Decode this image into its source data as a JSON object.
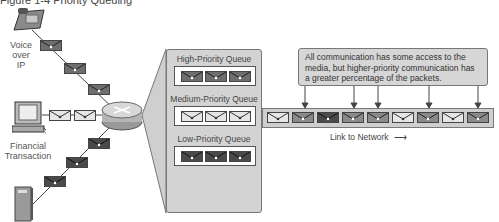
{
  "caption": "Figure 1-4  Priority Queuing",
  "sources": [
    {
      "label_lines": [
        "Voice",
        "over",
        "IP"
      ],
      "icon": "ip-phone-icon"
    },
    {
      "label_lines": [
        "Financial",
        "Transaction"
      ],
      "icon": "workstation-icon"
    },
    {
      "label_lines": [],
      "icon": "server-icon"
    }
  ],
  "router": {
    "icon": "router-icon"
  },
  "queues": [
    {
      "title": "High-Priority Queue",
      "packet_shade": "#6e6e6e",
      "packets": 3
    },
    {
      "title": "Medium-Priority Queue",
      "packet_shade": "#e6e6e6",
      "packets": 3
    },
    {
      "title": "Low-Priority Queue",
      "packet_shade": "#4a4a4a",
      "packets": 3
    }
  ],
  "note": {
    "text": "All communication has some access to the media, but higher-priority communication has a greater percentage of the packets."
  },
  "link": {
    "label": "Link to Network",
    "arrow": "→",
    "packet_shades": [
      "#e6e6e6",
      "#8a8a8a",
      "#4a4a4a",
      "#8a8a8a",
      "#8a8a8a",
      "#e6e6e6",
      "#8a8a8a",
      "#e6e6e6",
      "#8a8a8a"
    ]
  },
  "colors": {
    "panel_fill": "#d3d3d3",
    "outline": "#555555",
    "high": "#6e6e6e",
    "medium": "#e6e6e6",
    "low": "#4a4a4a"
  }
}
